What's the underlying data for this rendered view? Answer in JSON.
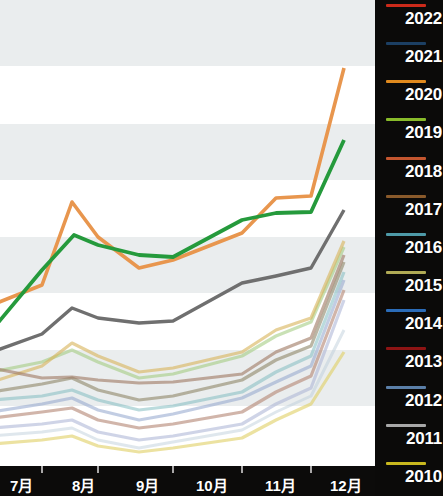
{
  "chart_data": {
    "type": "line",
    "title": "",
    "subtitle": "",
    "xlabel": "",
    "ylabel": "",
    "grid": "horizontal-alternating-bands",
    "legend_position": "right",
    "x": [
      "7月",
      "8月",
      "9月",
      "10月",
      "11月",
      "12月"
    ],
    "categories": [
      "7月",
      "8月",
      "9月",
      "10月",
      "11月",
      "12月"
    ],
    "xlim": [
      0,
      6
    ],
    "ylim": [
      0,
      100
    ],
    "series": [
      {
        "name": "2022",
        "color": "#cc2a1a",
        "values": [
          21,
          26,
          31,
          36,
          42,
          54
        ]
      },
      {
        "name": "2021",
        "color": "#1f4e79",
        "values": [
          17,
          22,
          26,
          31,
          36,
          47
        ]
      },
      {
        "name": "2020",
        "color": "#e8964e",
        "values": [
          34,
          56,
          45,
          50,
          55,
          85
        ]
      },
      {
        "name": "2019",
        "color": "#7fba1f",
        "values": [
          26,
          34,
          32,
          37,
          43,
          58
        ]
      },
      {
        "name": "2018",
        "color": "#c4562f",
        "values": [
          16,
          21,
          24,
          29,
          33,
          44
        ]
      },
      {
        "name": "2017",
        "color": "#8a5a2b",
        "values": [
          24,
          31,
          29,
          34,
          39,
          52
        ]
      },
      {
        "name": "2016",
        "color": "#4e9aa8",
        "values": [
          19,
          25,
          23,
          28,
          33,
          45
        ]
      },
      {
        "name": "2015",
        "color": "#b0aa55",
        "values": [
          14,
          19,
          21,
          26,
          30,
          41
        ]
      },
      {
        "name": "2014",
        "color": "#2b6cb8",
        "values": [
          11,
          16,
          18,
          23,
          27,
          38
        ]
      },
      {
        "name": "2013",
        "color": "#9a1b1b",
        "values": [
          9,
          13,
          15,
          20,
          24,
          35
        ]
      },
      {
        "name": "2012",
        "color": "#5b7fa8",
        "values": [
          7,
          11,
          13,
          17,
          21,
          31
        ]
      },
      {
        "name": "2011",
        "color": "#a8a8a8",
        "values": [
          31,
          42,
          38,
          44,
          47,
          63
        ]
      },
      {
        "name": "2010",
        "color": "#c9b81e",
        "values": [
          5,
          8,
          10,
          13,
          16,
          26
        ]
      },
      {
        "name": "green-highlight",
        "color": "#259a3c",
        "values": [
          34,
          49,
          43,
          50,
          51,
          76
        ]
      },
      {
        "name": "gray-highlight",
        "color": "#6b6b6b",
        "values": [
          26,
          35,
          33,
          39,
          42,
          58
        ]
      }
    ],
    "lines_rendered": [
      {
        "name": "2020",
        "color": "#e8964e",
        "width": 3.6,
        "opacity": 1,
        "points": [
          [
            -8,
            305
          ],
          [
            42,
            285
          ],
          [
            72,
            202
          ],
          [
            98,
            237
          ],
          [
            139,
            268
          ],
          [
            173,
            260
          ],
          [
            242,
            233
          ],
          [
            276,
            198
          ],
          [
            311,
            196
          ],
          [
            344,
            68
          ]
        ]
      },
      {
        "name": "green-highlight",
        "color": "#259a3c",
        "width": 3.8,
        "opacity": 1,
        "points": [
          [
            -8,
            330
          ],
          [
            42,
            270
          ],
          [
            74,
            235
          ],
          [
            98,
            245
          ],
          [
            139,
            255
          ],
          [
            173,
            257
          ],
          [
            242,
            220
          ],
          [
            276,
            213
          ],
          [
            311,
            212
          ],
          [
            344,
            140
          ]
        ]
      },
      {
        "name": "gray-highlight",
        "color": "#6f6f6f",
        "width": 3.4,
        "opacity": 1,
        "points": [
          [
            -8,
            352
          ],
          [
            42,
            334
          ],
          [
            72,
            308
          ],
          [
            98,
            318
          ],
          [
            139,
            323
          ],
          [
            173,
            321
          ],
          [
            242,
            283
          ],
          [
            276,
            276
          ],
          [
            311,
            268
          ],
          [
            344,
            210
          ]
        ]
      },
      {
        "name": "2015",
        "color": "#d8b45c",
        "width": 3.2,
        "opacity": 0.62,
        "points": [
          [
            -8,
            382
          ],
          [
            42,
            366
          ],
          [
            72,
            343
          ],
          [
            98,
            356
          ],
          [
            139,
            372
          ],
          [
            173,
            368
          ],
          [
            242,
            352
          ],
          [
            276,
            330
          ],
          [
            311,
            318
          ],
          [
            344,
            241
          ]
        ]
      },
      {
        "name": "2019",
        "color": "#9cc878",
        "width": 3.2,
        "opacity": 0.55,
        "points": [
          [
            -8,
            372
          ],
          [
            42,
            362
          ],
          [
            72,
            350
          ],
          [
            98,
            362
          ],
          [
            139,
            378
          ],
          [
            173,
            374
          ],
          [
            242,
            356
          ],
          [
            276,
            336
          ],
          [
            311,
            322
          ],
          [
            344,
            247
          ]
        ]
      },
      {
        "name": "2017",
        "color": "#a07b64",
        "width": 3.2,
        "opacity": 0.62,
        "points": [
          [
            -8,
            368
          ],
          [
            42,
            378
          ],
          [
            72,
            377
          ],
          [
            98,
            380
          ],
          [
            139,
            383
          ],
          [
            173,
            382
          ],
          [
            242,
            374
          ],
          [
            276,
            352
          ],
          [
            311,
            338
          ],
          [
            344,
            255
          ]
        ]
      },
      {
        "name": "2011-b",
        "color": "#8d8568",
        "width": 3.2,
        "opacity": 0.6,
        "points": [
          [
            -8,
            392
          ],
          [
            42,
            384
          ],
          [
            72,
            378
          ],
          [
            98,
            390
          ],
          [
            139,
            400
          ],
          [
            173,
            396
          ],
          [
            242,
            380
          ],
          [
            276,
            360
          ],
          [
            311,
            346
          ],
          [
            344,
            262
          ]
        ]
      },
      {
        "name": "2016",
        "color": "#78b8bc",
        "width": 3.2,
        "opacity": 0.5,
        "points": [
          [
            -8,
            400
          ],
          [
            42,
            396
          ],
          [
            72,
            390
          ],
          [
            98,
            400
          ],
          [
            139,
            410
          ],
          [
            173,
            406
          ],
          [
            242,
            392
          ],
          [
            276,
            372
          ],
          [
            311,
            356
          ],
          [
            344,
            272
          ]
        ]
      },
      {
        "name": "2014",
        "color": "#8fa4cc",
        "width": 3.2,
        "opacity": 0.55,
        "points": [
          [
            -8,
            412
          ],
          [
            42,
            404
          ],
          [
            72,
            398
          ],
          [
            98,
            410
          ],
          [
            139,
            420
          ],
          [
            173,
            414
          ],
          [
            242,
            398
          ],
          [
            276,
            382
          ],
          [
            311,
            366
          ],
          [
            344,
            280
          ]
        ]
      },
      {
        "name": "2018",
        "color": "#b38472",
        "width": 3.2,
        "opacity": 0.6,
        "points": [
          [
            -8,
            418
          ],
          [
            42,
            412
          ],
          [
            72,
            408
          ],
          [
            98,
            420
          ],
          [
            139,
            428
          ],
          [
            173,
            424
          ],
          [
            242,
            412
          ],
          [
            276,
            392
          ],
          [
            311,
            376
          ],
          [
            344,
            290
          ]
        ]
      },
      {
        "name": "2012",
        "color": "#a8b0d4",
        "width": 3.2,
        "opacity": 0.55,
        "points": [
          [
            -8,
            428
          ],
          [
            42,
            424
          ],
          [
            72,
            420
          ],
          [
            98,
            432
          ],
          [
            139,
            440
          ],
          [
            173,
            436
          ],
          [
            242,
            424
          ],
          [
            276,
            404
          ],
          [
            311,
            388
          ],
          [
            344,
            300
          ]
        ]
      },
      {
        "name": "2010",
        "color": "#e0ce62",
        "width": 3.2,
        "opacity": 0.6,
        "points": [
          [
            -8,
            444
          ],
          [
            42,
            440
          ],
          [
            72,
            436
          ],
          [
            98,
            446
          ],
          [
            139,
            452
          ],
          [
            173,
            448
          ],
          [
            242,
            438
          ],
          [
            276,
            420
          ],
          [
            311,
            404
          ],
          [
            344,
            352
          ]
        ]
      },
      {
        "name": "2013",
        "color": "#b9c9d8",
        "width": 3.0,
        "opacity": 0.45,
        "points": [
          [
            -8,
            436
          ],
          [
            42,
            432
          ],
          [
            72,
            428
          ],
          [
            98,
            440
          ],
          [
            139,
            448
          ],
          [
            173,
            442
          ],
          [
            242,
            430
          ],
          [
            276,
            412
          ],
          [
            311,
            396
          ],
          [
            344,
            330
          ]
        ]
      }
    ],
    "bands": [
      {
        "y": 0,
        "height": 66,
        "fill": "#eaedee"
      },
      {
        "y": 66,
        "height": 58,
        "fill": "#ffffff"
      },
      {
        "y": 124,
        "height": 56,
        "fill": "#eaedee"
      },
      {
        "y": 180,
        "height": 57,
        "fill": "#ffffff"
      },
      {
        "y": 237,
        "height": 56,
        "fill": "#eaedee"
      },
      {
        "y": 293,
        "height": 57,
        "fill": "#ffffff"
      },
      {
        "y": 350,
        "height": 56,
        "fill": "#eaedee"
      },
      {
        "y": 406,
        "height": 59,
        "fill": "#ffffff"
      }
    ]
  },
  "x_axis": {
    "ticks": [
      {
        "label": "7月",
        "x": 10,
        "tick_x": 42
      },
      {
        "label": "8月",
        "x": 72,
        "tick_x": 98
      },
      {
        "label": "9月",
        "x": 136,
        "tick_x": 173
      },
      {
        "label": "10月",
        "x": 196,
        "tick_x": 242
      },
      {
        "label": "11月",
        "x": 265,
        "tick_x": 311
      },
      {
        "label": "12月",
        "x": 330,
        "tick_x": 375
      }
    ],
    "axis_color": "#ffffff",
    "background": "#0c0b0a"
  },
  "legend": {
    "background": "#0b0a09",
    "text_color": "#ffffff",
    "items": [
      {
        "label": "2022",
        "color": "#cc2a1a"
      },
      {
        "label": "2021",
        "color": "#1c3f63"
      },
      {
        "label": "2020",
        "color": "#e08a1e"
      },
      {
        "label": "2019",
        "color": "#88bb2a"
      },
      {
        "label": "2018",
        "color": "#c4562f"
      },
      {
        "label": "2017",
        "color": "#8a5a2b"
      },
      {
        "label": "2016",
        "color": "#4e9aa8"
      },
      {
        "label": "2015",
        "color": "#b0aa55"
      },
      {
        "label": "2014",
        "color": "#2b6cb8"
      },
      {
        "label": "2013",
        "color": "#8e1414"
      },
      {
        "label": "2012",
        "color": "#5b7fa8"
      },
      {
        "label": "2011",
        "color": "#a8a8a8"
      },
      {
        "label": "2010",
        "color": "#c9b81e"
      }
    ]
  }
}
